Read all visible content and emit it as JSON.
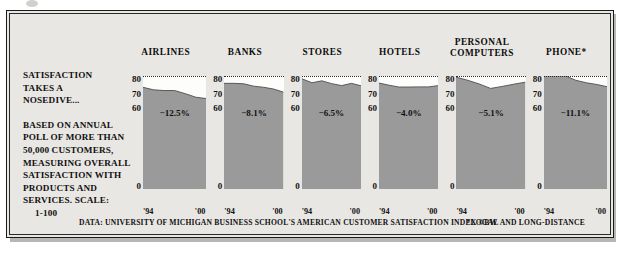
{
  "figure": {
    "headline_line1": "SATISFACTION",
    "headline_line2": "TAKES A",
    "headline_line3": "NOSEDIVE...",
    "blurb_line1": "BASED ON ANNUAL",
    "blurb_line2": "POLL OF MORE THAN",
    "blurb_line3": "50,000 CUSTOMERS,",
    "blurb_line4": "MEASURING OVERALL",
    "blurb_line5": "SATISFACTION WITH",
    "blurb_line6": "PRODUCTS AND",
    "blurb_line7": "SERVICES. SCALE:",
    "blurb_line8": "1-100",
    "source": "DATA: UNIVERSITY OF MICHIGAN BUSINESS SCHOOL'S AMERICAN CUSTOMER SATISFACTION INDEX ©BW",
    "footnote": "*LOCAL AND LONG-DISTANCE",
    "colors": {
      "area_fill": "#9a9a9a",
      "area_stroke": "#4d4d4d",
      "plot_background": "#fdfdfb",
      "page_background": "#e9e7e3",
      "text": "#111111"
    }
  },
  "chart_data": {
    "type": "area",
    "title": "SATISFACTION TAKES A NOSEDIVE...",
    "xlabel": "",
    "ylabel": "",
    "ylim": [
      0,
      80
    ],
    "yticks": [
      80,
      70,
      60,
      0
    ],
    "xticks": [
      "'94",
      "'00"
    ],
    "grid": "dotted gridline at 80 across all panels",
    "legend": "none",
    "x": [
      1994,
      1995,
      1996,
      1997,
      1998,
      1999,
      2000
    ],
    "series": [
      {
        "name": "AIRLINES",
        "change_label": "−12.5%",
        "change_pct": -12.5,
        "values": [
          72.0,
          70.2,
          69.7,
          69.7,
          67.5,
          65.0,
          64.0
        ]
      },
      {
        "name": "BANKS",
        "change_label": "−8.1%",
        "change_pct": -8.1,
        "values": [
          74.8,
          74.8,
          74.5,
          72.8,
          72.0,
          70.8,
          68.6
        ]
      },
      {
        "name": "STORES",
        "change_label": "−6.5%",
        "change_pct": -6.5,
        "values": [
          78.0,
          75.2,
          76.6,
          74.6,
          73.2,
          74.8,
          73.0
        ]
      },
      {
        "name": "HOTELS",
        "change_label": "−4.0%",
        "change_pct": -4.0,
        "values": [
          75.0,
          73.5,
          72.2,
          72.2,
          72.3,
          72.3,
          73.2
        ]
      },
      {
        "name": "PERSONAL COMPUTERS",
        "change_label": "−5.1%",
        "change_pct": -5.1,
        "values": [
          79.2,
          77.0,
          74.4,
          71.2,
          72.6,
          74.2,
          75.6
        ]
      },
      {
        "name": "PHONE*",
        "change_label": "−11.1%",
        "change_pct": -11.1,
        "values": [
          81.0,
          81.0,
          80.2,
          77.0,
          75.2,
          74.0,
          72.4
        ]
      }
    ]
  }
}
